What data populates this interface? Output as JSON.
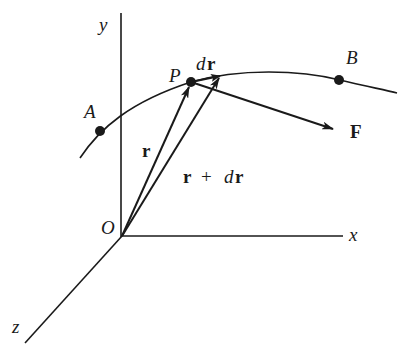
{
  "diagram": {
    "type": "vector-line-integral-diagram",
    "colors": {
      "ink": "#1a1a1a",
      "background": "#ffffff"
    },
    "axes": {
      "x_label": "x",
      "y_label": "y",
      "z_label": "z",
      "origin_label": "O"
    },
    "curve": {
      "start_point_label": "A",
      "end_point_label": "B",
      "point_on_curve_label": "P"
    },
    "vectors": {
      "position": {
        "label": "r"
      },
      "position_plus_displacement": {
        "label_r": "r",
        "label_plus": "+",
        "label_d": "d",
        "label_r2": "r"
      },
      "displacement": {
        "label_d": "d",
        "label_r": "r"
      },
      "force": {
        "label": "F"
      }
    }
  }
}
